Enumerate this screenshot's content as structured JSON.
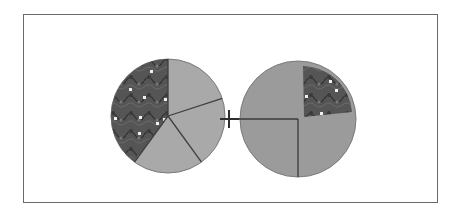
{
  "diagram": {
    "type": "fraction-addition-model",
    "operator": "+",
    "colors": {
      "frame": "#6a6a6a",
      "left_unshaded": "#a9a9a9",
      "right_unshaded": "#9b9b9b",
      "shaded": "#545454",
      "divider": "#3a3a3a",
      "dots": "#f2f2f2"
    },
    "left_circle": {
      "parts": 5,
      "shaded_parts": 2,
      "fraction": "2/5"
    },
    "right_circle": {
      "parts": 4,
      "shaded_parts": 1,
      "fraction": "1/4"
    }
  }
}
